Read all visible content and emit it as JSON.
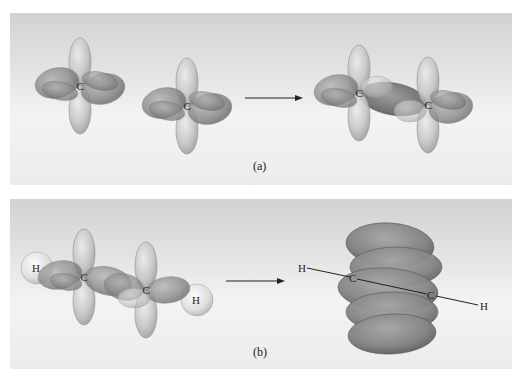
{
  "figure": {
    "panels": [
      {
        "id": "a",
        "caption": "(a)",
        "left_atoms": [
          {
            "label": "C"
          },
          {
            "label": "C"
          }
        ],
        "right_atoms": [
          {
            "label": "C"
          },
          {
            "label": "C"
          }
        ],
        "description": "Two sp2-hybridized carbon atoms combine to form a sigma bond"
      },
      {
        "id": "b",
        "caption": "(b)",
        "left_atoms": [
          {
            "label": "H"
          },
          {
            "label": "C"
          },
          {
            "label": "C"
          },
          {
            "label": "H"
          }
        ],
        "right_atoms": [
          {
            "label": "H"
          },
          {
            "label": "C"
          },
          {
            "label": "C"
          },
          {
            "label": "H"
          }
        ],
        "description": "Unhybridized p orbitals overlap to form pi bonds around the H-C-C-H axis"
      }
    ],
    "colors": {
      "light_lobe": "#c8c8c8",
      "dark_lobe": "#8e8e8e",
      "sigma_bond": "#7a7a7a",
      "pi_cloud": "#8a8a8a",
      "hydrogen": "#e6e6e6",
      "background_top": "#d2d2d2",
      "background_bottom": "#f3f3f3"
    }
  }
}
